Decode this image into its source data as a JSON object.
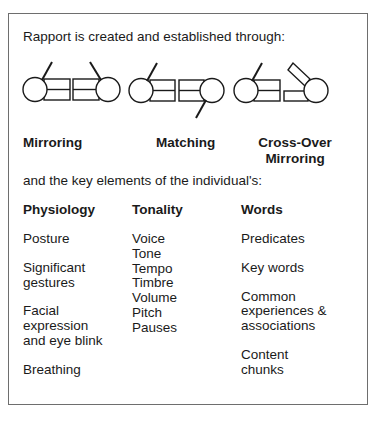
{
  "intro_text": "Rapport is created and established through:",
  "methods": [
    {
      "label": "Mirroring"
    },
    {
      "label": "Matching"
    },
    {
      "label_line1": "Cross-Over",
      "label_line2": "Mirroring"
    }
  ],
  "elements_intro": "and the key elements of the individual's:",
  "columns": [
    {
      "heading": "Physiology",
      "items": [
        "Posture",
        "Significant gestures",
        "Facial expression and eye blink",
        "Breathing"
      ],
      "lines": [
        [
          "Posture"
        ],
        [
          "Significant",
          "gestures"
        ],
        [
          "Facial",
          "expression",
          "and eye blink"
        ],
        [
          "Breathing"
        ]
      ]
    },
    {
      "heading": "Tonality",
      "items": [
        "Voice",
        "Tone",
        "Tempo",
        "Timbre",
        "Volume",
        "Pitch",
        "Pauses"
      ]
    },
    {
      "heading": "Words",
      "items": [
        "Predicates",
        "Key words",
        "Common experiences & associations",
        "Content chunks"
      ],
      "lines": [
        [
          "Predicates"
        ],
        [
          "Key words"
        ],
        [
          "Common",
          "experiences &",
          "associations"
        ],
        [
          "Content",
          "chunks"
        ]
      ]
    }
  ],
  "colors": {
    "border": "#6e6e6e",
    "ink": "#1a1a1a"
  }
}
